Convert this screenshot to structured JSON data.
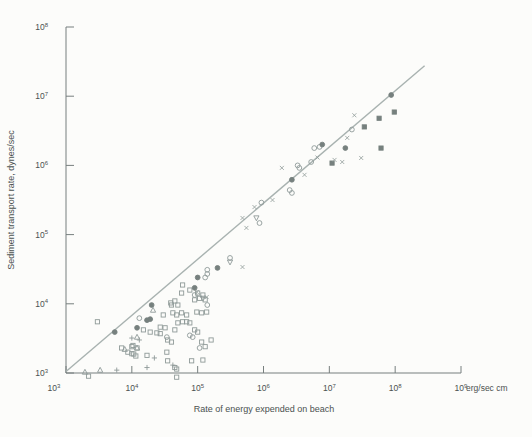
{
  "chart_data": {
    "type": "scatter",
    "title": "",
    "xlabel": "Rate of energy expended on beach",
    "ylabel": "Sediment transport rate, dynes/sec",
    "x_unit_label": "erg/sec cm",
    "tick_base": "10",
    "x_tick_exponents": [
      3,
      4,
      5,
      6,
      7,
      8,
      9
    ],
    "y_tick_exponents": [
      3,
      4,
      5,
      6,
      7,
      8
    ],
    "xlim": [
      1000,
      1000000000
    ],
    "ylim": [
      1000,
      100000000
    ],
    "grid": false,
    "legend": "none",
    "axes_log": true,
    "fit_line": {
      "x1": 1000,
      "y1": 1050,
      "x2": 280000000,
      "y2": 27500000
    },
    "colors": {
      "background": "#fcfcfa",
      "axis": "#777f7e",
      "text": "#4b5150",
      "marker_open": "#8f9a98",
      "marker_filled": "#76807e",
      "fit_line": "#a8b2b0"
    },
    "series": [
      {
        "name": "open-square",
        "marker": "square",
        "filled": false,
        "points": [
          [
            3000,
            5500
          ],
          [
            10400,
            2500
          ],
          [
            8700,
            2000
          ],
          [
            10000,
            1900
          ],
          [
            10700,
            1880
          ],
          [
            11500,
            1760
          ],
          [
            15000,
            4200
          ],
          [
            19000,
            3900
          ],
          [
            30000,
            6900
          ],
          [
            27000,
            4600
          ],
          [
            32000,
            4500
          ],
          [
            24000,
            3800
          ],
          [
            27000,
            3700
          ],
          [
            35000,
            3000
          ],
          [
            40000,
            2800
          ],
          [
            45000,
            4200
          ],
          [
            40000,
            9600
          ],
          [
            45000,
            11000
          ],
          [
            50000,
            9600
          ],
          [
            42000,
            7400
          ],
          [
            48000,
            6900
          ],
          [
            57000,
            7400
          ],
          [
            68000,
            6900
          ],
          [
            50000,
            5300
          ],
          [
            59000,
            5500
          ],
          [
            90000,
            11400
          ],
          [
            107000,
            12000
          ],
          [
            130000,
            11400
          ],
          [
            97000,
            7600
          ],
          [
            115000,
            7400
          ],
          [
            137000,
            7600
          ],
          [
            68000,
            5500
          ],
          [
            76000,
            5300
          ],
          [
            90000,
            4200
          ],
          [
            100000,
            3900
          ],
          [
            115000,
            2800
          ],
          [
            160000,
            3000
          ],
          [
            35000,
            1500
          ],
          [
            45000,
            1200
          ],
          [
            48000,
            1140
          ],
          [
            130000,
            2400
          ],
          [
            59000,
            18700
          ],
          [
            100000,
            14300
          ],
          [
            120000,
            13400
          ],
          [
            17000,
            1800
          ],
          [
            34000,
            2000
          ],
          [
            81000,
            1500
          ],
          [
            120000,
            1540
          ],
          [
            7000,
            2300
          ],
          [
            10000,
            2400
          ],
          [
            12000,
            2300
          ],
          [
            57000,
            14300
          ],
          [
            76000,
            15800
          ],
          [
            39000,
            10300
          ],
          [
            2200,
            900
          ],
          [
            48000,
            870
          ]
        ]
      },
      {
        "name": "open-circle",
        "marker": "circle",
        "filled": false,
        "points": [
          [
            13000,
            6200
          ],
          [
            34000,
            3300
          ],
          [
            140000,
            9600
          ],
          [
            76000,
            3500
          ],
          [
            84000,
            3300
          ],
          [
            107000,
            2300
          ],
          [
            90000,
            13400
          ],
          [
            310000,
            46000
          ],
          [
            140000,
            31000
          ],
          [
            140000,
            27000
          ],
          [
            130000,
            24000
          ],
          [
            930000,
            290000
          ],
          [
            870000,
            147000
          ],
          [
            2500000,
            440000
          ],
          [
            2700000,
            400000
          ],
          [
            3300000,
            1000000
          ],
          [
            3500000,
            920000
          ],
          [
            5300000,
            1120000
          ],
          [
            5900000,
            1780000
          ],
          [
            7100000,
            1850000
          ],
          [
            22000000,
            3300000
          ]
        ]
      },
      {
        "name": "filled-circle",
        "marker": "circle",
        "filled": true,
        "points": [
          [
            5500,
            3900
          ],
          [
            12000,
            4500
          ],
          [
            17000,
            5800
          ],
          [
            19000,
            6000
          ],
          [
            20000,
            9600
          ],
          [
            90000,
            17000
          ],
          [
            200000,
            33000
          ],
          [
            100000,
            24000
          ],
          [
            2700000,
            620000
          ],
          [
            7800000,
            2000000
          ],
          [
            17500000,
            1780000
          ],
          [
            87000000,
            10400000
          ]
        ]
      },
      {
        "name": "filled-square",
        "marker": "square",
        "filled": true,
        "points": [
          [
            11000000,
            1080000
          ],
          [
            97000000,
            5900000
          ],
          [
            57000000,
            4800000
          ],
          [
            34000000,
            3600000
          ],
          [
            61000000,
            1780000
          ]
        ]
      },
      {
        "name": "open-triangle-up",
        "marker": "triangle-up",
        "filled": false,
        "points": [
          [
            1940,
            1030
          ],
          [
            3300,
            1100
          ],
          [
            12000,
            3300
          ],
          [
            12000,
            2300
          ],
          [
            21000,
            8100
          ],
          [
            7800,
            2200
          ]
        ]
      },
      {
        "name": "open-triangle-down",
        "marker": "triangle-down",
        "filled": false,
        "points": [
          [
            120000,
            12000
          ],
          [
            310000,
            40000
          ],
          [
            780000,
            174000
          ]
        ]
      },
      {
        "name": "plus",
        "marker": "plus",
        "filled": false,
        "points": [
          [
            5900,
            1100
          ],
          [
            10000,
            3200
          ],
          [
            13000,
            3000
          ],
          [
            22000,
            1650
          ],
          [
            17000,
            1200
          ],
          [
            42000,
            1300
          ]
        ]
      },
      {
        "name": "x-cross",
        "marker": "x",
        "filled": false,
        "points": [
          [
            137000,
            12500
          ],
          [
            97000,
            14800
          ],
          [
            480000,
            34000
          ],
          [
            480000,
            174000
          ],
          [
            730000,
            250000
          ],
          [
            550000,
            125000
          ],
          [
            1370000,
            316000
          ],
          [
            1900000,
            920000
          ],
          [
            4200000,
            730000
          ],
          [
            6600000,
            1300000
          ],
          [
            15700000,
            1120000
          ],
          [
            12000000,
            1200000
          ],
          [
            18700000,
            2500000
          ],
          [
            24000000,
            5300000
          ],
          [
            30500000,
            1280000
          ]
        ]
      }
    ]
  }
}
